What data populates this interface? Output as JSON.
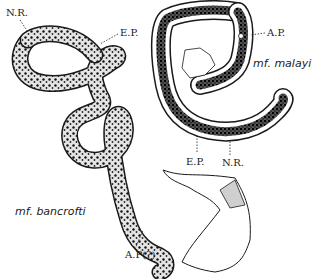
{
  "figure": {
    "specimens": [
      {
        "name": "mf. bancrofti",
        "labels": [
          "N.R.",
          "E.P.",
          "A.P(?)"
        ]
      },
      {
        "name": "mf. malayi",
        "labels": [
          "A.P.",
          "E.P.",
          "N.R."
        ]
      }
    ]
  },
  "labels": {
    "bancrofti_nr": "N.R.",
    "bancrofti_ep": "E.P.",
    "bancrofti_ap": "A.P(?)",
    "malayi_ap": "A.P.",
    "malayi_ep": "E.P.",
    "malayi_nr": "N.R."
  },
  "species": {
    "bancrofti": "mf. bancrofti",
    "malayi": "mf. malayi"
  },
  "colors": {
    "ink": "#1a1a1a",
    "stipple": "#cfcfcf",
    "background": "#ffffff"
  }
}
